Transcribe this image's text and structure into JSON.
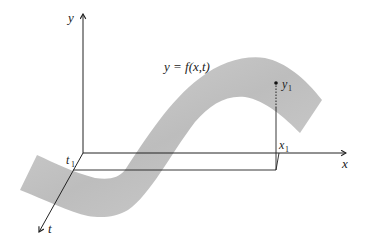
{
  "diagram": {
    "surface_label": "y = f(x,t)",
    "axes": {
      "y_label": "y",
      "x_label": "x",
      "t_label": "t"
    },
    "points": {
      "t1_label": "t",
      "t1_sub": "1",
      "x1_label": "x",
      "x1_sub": "1",
      "y1_label": "y",
      "y1_sub": "1"
    },
    "colors": {
      "surface": "#c8c8c8",
      "axis": "#222222",
      "background": "#ffffff"
    }
  }
}
